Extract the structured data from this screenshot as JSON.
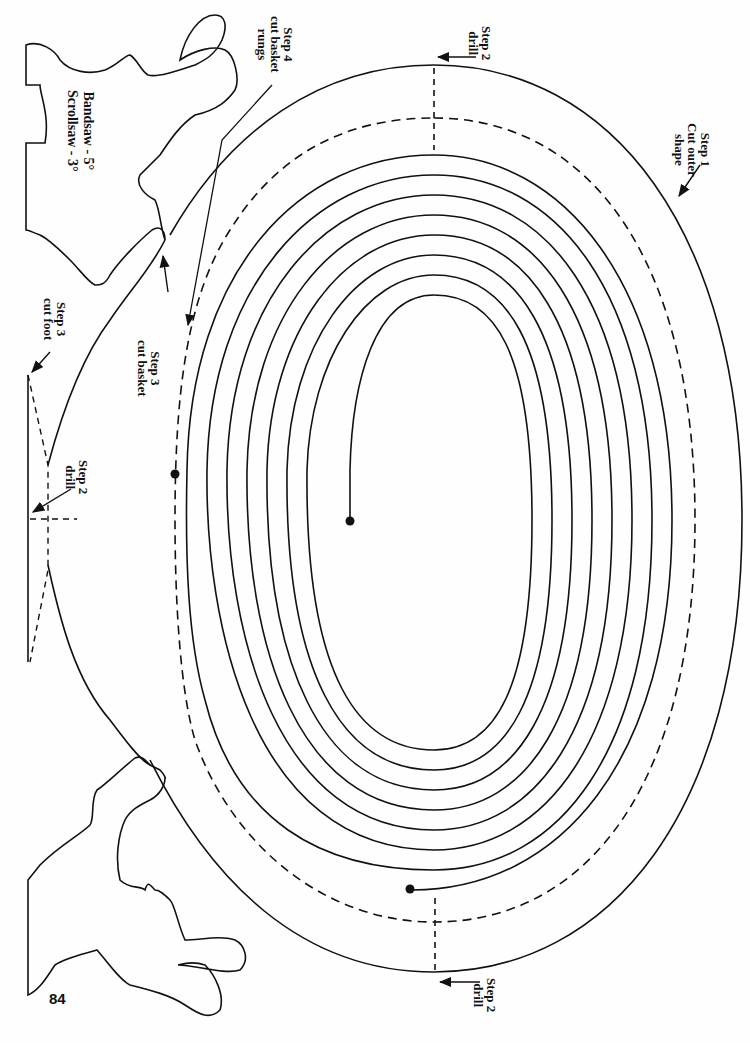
{
  "page_number": "84",
  "saw_settings": {
    "line1": "Bandsaw - 5°",
    "line2": "Scrollsaw - 3°"
  },
  "labels": {
    "step1": {
      "line1": "Step 1",
      "line2": "Cut outer",
      "line3": "shape"
    },
    "step2_top": {
      "line1": "Step 2",
      "line2": "drill"
    },
    "step2_bottom": {
      "line1": "Step 2",
      "line2": "drill"
    },
    "step2_foot": {
      "line1": "Step 2",
      "line2": "drill"
    },
    "step3_basket": {
      "line1": "Step 3",
      "line2": "cut basket"
    },
    "step3_foot": {
      "line1": "Step 3",
      "line2": "cut foot"
    },
    "step4": {
      "line1": "Step 4",
      "line2": "cut basket",
      "line3": "rungs"
    }
  },
  "colors": {
    "ink": "#111111",
    "paper": "#fefefe"
  },
  "diagram": {
    "type": "scroll-saw pattern",
    "spiral_loops": 8
  }
}
